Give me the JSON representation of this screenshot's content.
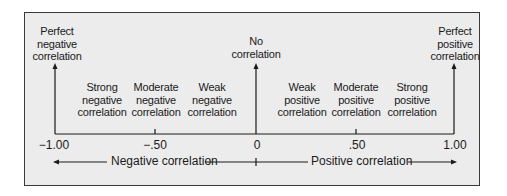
{
  "diagram": {
    "type": "correlation-scale",
    "axis": {
      "ticks": [
        {
          "value": -1.0,
          "label": "−1.00"
        },
        {
          "value": -0.5,
          "label": "−.50"
        },
        {
          "value": 0.0,
          "label": "0"
        },
        {
          "value": 0.5,
          "label": ".50"
        },
        {
          "value": 1.0,
          "label": "1.00"
        }
      ]
    },
    "endpoint_labels": {
      "left": [
        "Perfect",
        "negative",
        "correlation"
      ],
      "center": [
        "No",
        "correlation"
      ],
      "right": [
        "Perfect",
        "positive",
        "correlation"
      ]
    },
    "region_labels": [
      [
        "Strong",
        "negative",
        "correlation"
      ],
      [
        "Moderate",
        "negative",
        "correlation"
      ],
      [
        "Weak",
        "negative",
        "correlation"
      ],
      [
        "Weak",
        "positive",
        "correlation"
      ],
      [
        "Moderate",
        "positive",
        "correlation"
      ],
      [
        "Strong",
        "positive",
        "correlation"
      ]
    ],
    "direction_labels": {
      "negative": "Negative correlation",
      "positive": "Positive correlation"
    },
    "colors": {
      "background": "#ececec",
      "line": "#1a1a1a",
      "border": "#3a3a3a"
    }
  }
}
